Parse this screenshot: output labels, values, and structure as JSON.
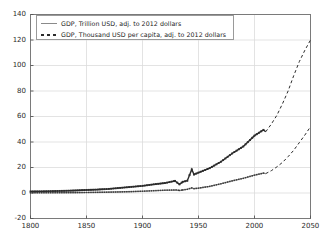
{
  "chart_data": {
    "type": "line",
    "title": "",
    "xlabel": "",
    "ylabel": "",
    "xlim": [
      1800,
      2050
    ],
    "ylim": [
      -20,
      140
    ],
    "xticks": [
      1800,
      1850,
      1900,
      1950,
      2000,
      2050
    ],
    "yticks": [
      -20,
      0,
      20,
      40,
      60,
      80,
      100,
      120,
      140
    ],
    "grid": true,
    "legend_position": "upper-left",
    "series": [
      {
        "name": "GDP, Trillion USD, adj. to 2012 dollars",
        "marker": "solid-line",
        "color": "#8a8a8a",
        "x": [
          1800,
          1810,
          1820,
          1830,
          1840,
          1850,
          1860,
          1870,
          1880,
          1890,
          1900,
          1910,
          1920,
          1930,
          1933,
          1936,
          1940,
          1944,
          1946,
          1950,
          1960,
          1970,
          1980,
          1990,
          2000,
          2008,
          2010
        ],
        "values": [
          0.18,
          0.2,
          0.23,
          0.27,
          0.33,
          0.42,
          0.52,
          0.65,
          0.85,
          1.1,
          1.4,
          1.8,
          2.2,
          2.4,
          2.0,
          2.4,
          2.9,
          4.0,
          3.4,
          3.8,
          5.2,
          7.2,
          9.5,
          11.5,
          14.0,
          15.6,
          15.2
        ]
      },
      {
        "name": "GDP, Thousand USD per capita, adj. to 2012 dollars",
        "marker": "dashed-square",
        "color": "#2b2b2b",
        "x": [
          1800,
          1810,
          1820,
          1830,
          1840,
          1850,
          1860,
          1870,
          1880,
          1890,
          1900,
          1910,
          1920,
          1929,
          1933,
          1936,
          1940,
          1944,
          1946,
          1950,
          1960,
          1970,
          1980,
          1990,
          2000,
          2008,
          2010
        ],
        "values": [
          1.2,
          1.3,
          1.5,
          1.7,
          2.0,
          2.4,
          2.7,
          3.2,
          4.0,
          4.8,
          5.6,
          6.8,
          7.8,
          9.5,
          6.8,
          8.8,
          9.6,
          18.5,
          14.5,
          16.0,
          19.5,
          24.5,
          31.0,
          36.5,
          45.0,
          49.5,
          48.0
        ]
      }
    ],
    "projections": [
      {
        "name": "GDP, Trillion USD, adj. to 2012 dollars (projected)",
        "style": "dashed",
        "x": [
          2010,
          2015,
          2020,
          2025,
          2030,
          2035,
          2040,
          2045,
          2050
        ],
        "values": [
          15.2,
          17.5,
          20.5,
          24.0,
          28.5,
          33.5,
          39.5,
          45.5,
          52.0
        ]
      },
      {
        "name": "GDP, Thousand USD per capita, adj. to 2012 dollars (projected)",
        "style": "dashed",
        "x": [
          2010,
          2015,
          2020,
          2025,
          2030,
          2035,
          2040,
          2045,
          2050
        ],
        "values": [
          48.0,
          54.0,
          61.0,
          70.0,
          80.0,
          92.0,
          103.0,
          112.0,
          120.0
        ]
      }
    ]
  },
  "legend": {
    "entries": [
      {
        "label": "GDP, Trillion USD, adj. to 2012 dollars",
        "marker": "solid-line"
      },
      {
        "label": "GDP, Thousand USD per capita, adj. to 2012 dollars",
        "marker": "dashed-square"
      }
    ]
  },
  "axes": {
    "x_tick_labels": [
      "1800",
      "1850",
      "1900",
      "1950",
      "2000",
      "2050"
    ],
    "y_tick_labels": [
      "140",
      "120",
      "100",
      "80",
      "60",
      "40",
      "20",
      "0",
      "-20"
    ]
  },
  "colors": {
    "background": "#ffffff",
    "axis": "#7a7a7a",
    "grid": "#dcdcdc",
    "series1": "#8a8a8a",
    "series2": "#2b2b2b",
    "text": "#2a2a2a"
  }
}
